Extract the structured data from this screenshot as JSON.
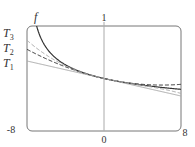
{
  "chart_data": {
    "type": "line",
    "title": "",
    "xlabel": "",
    "ylabel": "",
    "xlim": [
      -8,
      8
    ],
    "ylim": [
      0,
      1
    ],
    "grid": false,
    "x_tick_labels": [
      "-8",
      "0",
      "8"
    ],
    "y_tick_labels": [
      "1"
    ],
    "function_note": "f(x) = (8 + x)^(-1/3) with Taylor polynomials T1, T2, T3 centered at 0",
    "series": [
      {
        "name": "f",
        "label": "f",
        "style": "solid",
        "color": "#333333",
        "x": [
          -7,
          -6,
          -5,
          -4,
          -3,
          -2,
          -1,
          0,
          1,
          2,
          4,
          6,
          8
        ],
        "values": [
          1.0,
          0.794,
          0.693,
          0.63,
          0.585,
          0.55,
          0.523,
          0.5,
          0.481,
          0.464,
          0.437,
          0.415,
          0.397
        ]
      },
      {
        "name": "T1",
        "label": "T",
        "sub": "1",
        "style": "solid",
        "color": "#aaaaaa",
        "x": [
          -8,
          0,
          8
        ],
        "values": [
          0.667,
          0.5,
          0.333
        ]
      },
      {
        "name": "T2",
        "label": "T",
        "sub": "2",
        "style": "dashed",
        "color": "#333333",
        "x": [
          -8,
          -4,
          0,
          4,
          8
        ],
        "values": [
          0.778,
          0.611,
          0.5,
          0.444,
          0.444
        ]
      },
      {
        "name": "T3",
        "label": "T",
        "sub": "3",
        "style": "dashed",
        "color": "#aaaaaa",
        "x": [
          -8,
          -4,
          0,
          4,
          8
        ],
        "values": [
          0.864,
          0.622,
          0.5,
          0.433,
          0.358
        ]
      }
    ]
  }
}
